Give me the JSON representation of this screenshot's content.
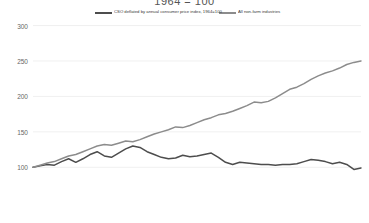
{
  "chart_data": {
    "type": "line",
    "title": "1964 = 100",
    "xlabel": "",
    "ylabel": "",
    "ylim": [
      75,
      305
    ],
    "yticks": [
      100,
      150,
      200,
      250,
      300
    ],
    "ytick_labels": [
      "100",
      "150",
      "200",
      "250",
      "300"
    ],
    "grid": true,
    "legend_position": "top-center",
    "colors": {
      "cso_deflated": "#4d4d4d",
      "non_farm": "#8c8c8c",
      "gridline": "#e9e9e9",
      "axis_text": "#666666",
      "title_text": "#555555"
    },
    "x": [
      1,
      2,
      3,
      4,
      5,
      6,
      7,
      8,
      9,
      10,
      11,
      12,
      13,
      14,
      15,
      16,
      17,
      18,
      19,
      20,
      21,
      22,
      23,
      24,
      25,
      26,
      27,
      28,
      29,
      30,
      31,
      32,
      33,
      34,
      35,
      36,
      37,
      38,
      39,
      40,
      41,
      42,
      43,
      44,
      45,
      46,
      47
    ],
    "series": [
      {
        "name": "CSO deflated by annual consumer price index, 1964=100",
        "color": "#4d4d4d",
        "values": [
          100,
          102,
          104,
          103,
          108,
          112,
          107,
          112,
          118,
          122,
          116,
          114,
          120,
          126,
          130,
          128,
          122,
          118,
          114,
          112,
          113,
          117,
          115,
          116,
          118,
          120,
          114,
          107,
          104,
          107,
          106,
          105,
          104,
          104,
          103,
          104,
          104,
          105,
          108,
          111,
          110,
          108,
          105,
          107,
          104,
          97,
          99
        ]
      },
      {
        "name": "All non-farm industries",
        "color": "#8c8c8c",
        "values": [
          100,
          103,
          106,
          108,
          112,
          116,
          118,
          122,
          126,
          130,
          132,
          131,
          134,
          137,
          136,
          139,
          143,
          147,
          150,
          153,
          157,
          156,
          159,
          163,
          167,
          170,
          174,
          176,
          179,
          183,
          187,
          192,
          191,
          193,
          198,
          204,
          210,
          213,
          218,
          224,
          229,
          233,
          236,
          240,
          245,
          248,
          250
        ]
      }
    ]
  },
  "legend": {
    "items": [
      {
        "label": "CSO deflated by annual consumer price index, 1964=100",
        "color": "#4d4d4d"
      },
      {
        "label": "All non-farm industries",
        "color": "#8c8c8c"
      }
    ]
  }
}
